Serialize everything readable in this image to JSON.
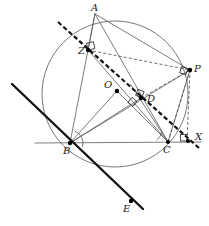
{
  "figure": {
    "type": "euclidean-geometry-diagram",
    "width": 209,
    "height": 226,
    "background": "#ffffff",
    "stroke_thin": "#5a5a5a",
    "stroke_dark": "#1a1a1a",
    "stroke_dashed": "#4a4a4a",
    "point_fill": "#000000"
  },
  "points": [
    {
      "id": "A",
      "label": "A",
      "x": 95,
      "y": 14,
      "label_x": 91,
      "label_y": 3,
      "dot": false
    },
    {
      "id": "Z",
      "label": "Z",
      "x": 88,
      "y": 50,
      "label_x": 78,
      "label_y": 46,
      "dot": true
    },
    {
      "id": "P",
      "label": "P",
      "x": 190,
      "y": 70,
      "label_x": 193,
      "label_y": 64,
      "dot": true
    },
    {
      "id": "O",
      "label": "O",
      "x": 117,
      "y": 91,
      "label_x": 104,
      "label_y": 80,
      "dot": true
    },
    {
      "id": "D",
      "label": "D",
      "x": 141,
      "y": 98,
      "label_x": 146,
      "label_y": 94,
      "dot": true
    },
    {
      "id": "B",
      "label": "B",
      "x": 70,
      "y": 143,
      "label_x": 64,
      "label_y": 146,
      "dot": true
    },
    {
      "id": "C",
      "label": "C",
      "x": 168,
      "y": 142,
      "label_x": 163,
      "label_y": 145,
      "dot": true
    },
    {
      "id": "X",
      "label": "X",
      "x": 189,
      "y": 141,
      "label_x": 194,
      "label_y": 133,
      "dot": true
    },
    {
      "id": "E",
      "label": "E",
      "x": 131,
      "y": 201,
      "label_x": 124,
      "label_y": 203,
      "dot": true
    }
  ],
  "circle": {
    "name": "circumcircle",
    "cx": 115,
    "cy": 94,
    "r": 73,
    "stroke": "#6a6a6a"
  },
  "segments": [
    {
      "name": "line-BC-horizontal",
      "from": [
        35,
        143
      ],
      "to": [
        201,
        142
      ],
      "style": "solid-thin"
    },
    {
      "name": "segment-AB",
      "from": [
        95,
        14
      ],
      "to": [
        70,
        143
      ],
      "style": "solid-thin"
    },
    {
      "name": "segment-AC",
      "from": [
        95,
        14
      ],
      "to": [
        168,
        142
      ],
      "style": "solid-thin"
    },
    {
      "name": "segment-AP",
      "from": [
        95,
        14
      ],
      "to": [
        190,
        70
      ],
      "style": "solid-thin"
    },
    {
      "name": "segment-AZ-foot",
      "from": [
        95,
        14
      ],
      "to": [
        88,
        50
      ],
      "style": "solid-thin"
    },
    {
      "name": "segment-BO",
      "from": [
        70,
        143
      ],
      "to": [
        117,
        91
      ],
      "style": "solid-thin"
    },
    {
      "name": "segment-OC",
      "from": [
        117,
        91
      ],
      "to": [
        168,
        142
      ],
      "style": "solid-thin"
    },
    {
      "name": "segment-BD",
      "from": [
        70,
        143
      ],
      "to": [
        141,
        98
      ],
      "style": "solid-thin"
    },
    {
      "name": "segment-BP",
      "from": [
        70,
        143
      ],
      "to": [
        190,
        70
      ],
      "style": "solid-thin"
    },
    {
      "name": "segment-CZ",
      "from": [
        168,
        142
      ],
      "to": [
        88,
        50
      ],
      "style": "solid-thin"
    },
    {
      "name": "segment-CD-up",
      "from": [
        168,
        142
      ],
      "to": [
        133,
        88
      ],
      "style": "solid-thin"
    },
    {
      "name": "segment-CP",
      "from": [
        168,
        142
      ],
      "to": [
        190,
        70
      ],
      "style": "solid-thin"
    }
  ],
  "dashed_segments": [
    {
      "name": "dashed-ZP",
      "from": [
        88,
        50
      ],
      "to": [
        190,
        70
      ]
    },
    {
      "name": "dashed-DP",
      "from": [
        141,
        98
      ],
      "to": [
        190,
        70
      ]
    },
    {
      "name": "dashed-CP-chord",
      "from": [
        168,
        142
      ],
      "to": [
        190,
        70
      ]
    },
    {
      "name": "dashed-PX-vertical",
      "from": [
        190,
        70
      ],
      "to": [
        187,
        140
      ]
    }
  ],
  "thick_lines": [
    {
      "name": "line-BE-transversal",
      "from": [
        12,
        84
      ],
      "to": [
        143,
        209
      ],
      "style": "solid-thick"
    },
    {
      "name": "line-ZDX-dashed-thick",
      "from": [
        58,
        22
      ],
      "to": [
        199,
        148
      ],
      "style": "dashed-thick"
    }
  ],
  "right_angle_markers": [
    {
      "name": "right-angle-at-Z",
      "x": 88,
      "y": 50,
      "rot": -15
    },
    {
      "name": "right-angle-at-D-upper",
      "x": 141,
      "y": 98,
      "rot": 20
    },
    {
      "name": "right-angle-at-D-lower",
      "x": 136,
      "y": 104,
      "rot": 40
    },
    {
      "name": "right-angle-at-P",
      "x": 190,
      "y": 70,
      "rot": 200
    },
    {
      "name": "right-angle-at-X",
      "x": 187,
      "y": 141,
      "rot": 180
    }
  ],
  "angle_arcs": [
    {
      "name": "angle-arc-at-B",
      "cx": 70,
      "cy": 143,
      "r": 13,
      "start": -70,
      "end": -5
    },
    {
      "name": "angle-arc-at-C",
      "cx": 168,
      "cy": 142,
      "r": 12,
      "start": 182,
      "end": 250
    }
  ]
}
